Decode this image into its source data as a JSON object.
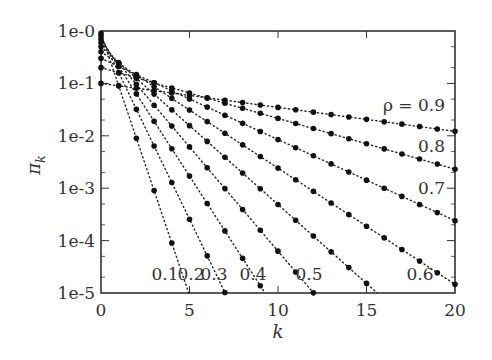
{
  "chart_data": {
    "type": "scatter",
    "title": "",
    "xlabel": "k",
    "ylabel": "π_k",
    "x_scale": "linear",
    "y_scale": "log",
    "xlim": [
      0,
      20
    ],
    "ylim": [
      1e-05,
      1
    ],
    "x_ticks": [
      0,
      5,
      10,
      15,
      20
    ],
    "x_tick_labels": [
      "0",
      "5",
      "10",
      "15",
      "20"
    ],
    "y_ticks": [
      1,
      0.1,
      0.01,
      0.001,
      0.0001,
      1e-05
    ],
    "y_tick_labels": [
      "1e-0",
      "1e-1",
      "1e-2",
      "1e-3",
      "1e-4",
      "1e-5"
    ],
    "grid": false,
    "line_style": "dotted with markers",
    "formula": "π_k = (1-ρ)ρ^k",
    "series": [
      {
        "name": "0.1",
        "rho": 0.1,
        "label": "0.1"
      },
      {
        "name": "0.2",
        "rho": 0.2,
        "label": "0.2"
      },
      {
        "name": "0.3",
        "rho": 0.3,
        "label": "0.3"
      },
      {
        "name": "0.4",
        "rho": 0.4,
        "label": "0.4"
      },
      {
        "name": "0.5",
        "rho": 0.5,
        "label": "0.5"
      },
      {
        "name": "0.6",
        "rho": 0.6,
        "label": "0.6"
      },
      {
        "name": "0.7",
        "rho": 0.7,
        "label": "0.7"
      },
      {
        "name": "0.8",
        "rho": 0.8,
        "label": "0.8"
      },
      {
        "name": "0.9",
        "rho": 0.9,
        "label": "ρ = 0.9"
      }
    ]
  },
  "labels": {
    "xlabel": "k",
    "ylabel": "π",
    "ylabel_sub": "k"
  }
}
